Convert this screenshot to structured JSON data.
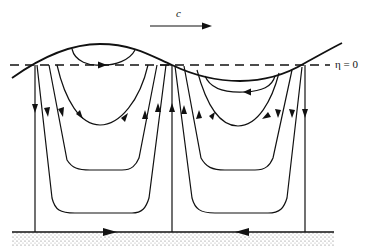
{
  "diagram": {
    "type": "wave-orbital-streamlines",
    "labels": {
      "propagation_speed": "c",
      "mean_level": "η = 0"
    },
    "colors": {
      "line": "#111111",
      "background": "#ffffff",
      "bed": "#bdbdbd"
    },
    "elements": {
      "free_surface": "sinusoidal wave surface",
      "mean_level_line": "dashed line η = 0",
      "bed": "stippled sea bed",
      "streamline_cells": [
        {
          "position": "under crest",
          "circulation": "clockwise",
          "bed_arrow": "right"
        },
        {
          "position": "under trough",
          "circulation": "counter-clockwise",
          "bed_arrow": "left"
        }
      ]
    }
  }
}
